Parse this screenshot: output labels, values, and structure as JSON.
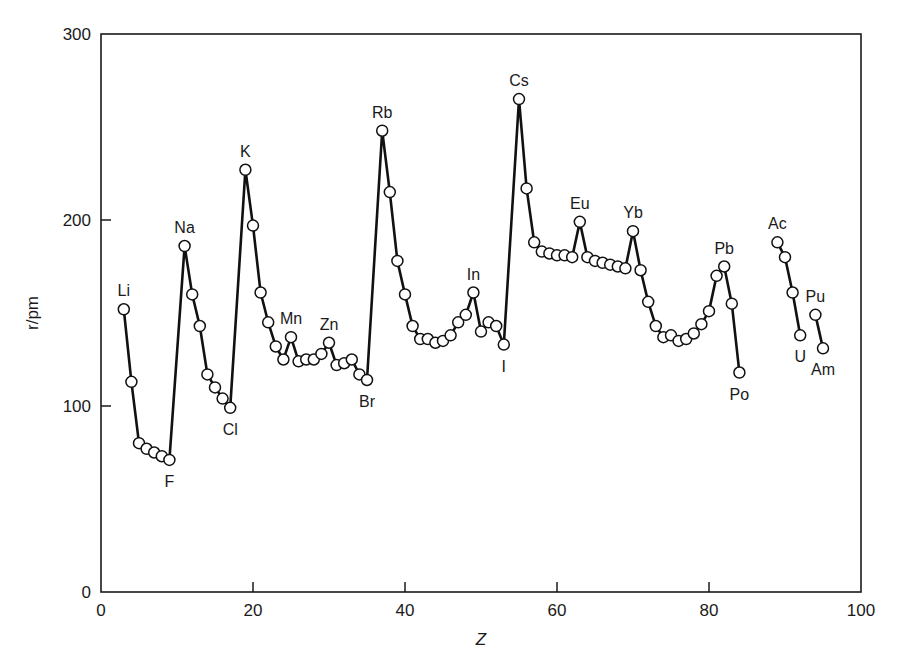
{
  "chart_data": {
    "type": "line",
    "title": "",
    "xlabel": "Z",
    "ylabel": "r/pm",
    "xlim": [
      0,
      100
    ],
    "ylim": [
      0,
      300
    ],
    "xticks": [
      0,
      20,
      40,
      60,
      80,
      100
    ],
    "yticks": [
      0,
      100,
      200,
      300
    ],
    "grid": false,
    "legend": null,
    "marker": "open-circle",
    "series": [
      {
        "name": "Li–Po",
        "points": [
          [
            3,
            152
          ],
          [
            4,
            113
          ],
          [
            5,
            80
          ],
          [
            6,
            77
          ],
          [
            7,
            75
          ],
          [
            8,
            73
          ],
          [
            9,
            71
          ],
          [
            11,
            186
          ],
          [
            12,
            160
          ],
          [
            13,
            143
          ],
          [
            14,
            117
          ],
          [
            15,
            110
          ],
          [
            16,
            104
          ],
          [
            17,
            99
          ],
          [
            19,
            227
          ],
          [
            20,
            197
          ],
          [
            21,
            161
          ],
          [
            22,
            145
          ],
          [
            23,
            132
          ],
          [
            24,
            125
          ],
          [
            25,
            137
          ],
          [
            26,
            124
          ],
          [
            27,
            125
          ],
          [
            28,
            125
          ],
          [
            29,
            128
          ],
          [
            30,
            134
          ],
          [
            31,
            122
          ],
          [
            32,
            123
          ],
          [
            33,
            125
          ],
          [
            34,
            117
          ],
          [
            35,
            114
          ],
          [
            37,
            248
          ],
          [
            38,
            215
          ],
          [
            39,
            178
          ],
          [
            40,
            160
          ],
          [
            41,
            143
          ],
          [
            42,
            136
          ],
          [
            43,
            136
          ],
          [
            44,
            134
          ],
          [
            45,
            135
          ],
          [
            46,
            138
          ],
          [
            47,
            145
          ],
          [
            48,
            149
          ],
          [
            49,
            161
          ],
          [
            50,
            140
          ],
          [
            51,
            145
          ],
          [
            52,
            143
          ],
          [
            53,
            133
          ],
          [
            55,
            265
          ],
          [
            56,
            217
          ],
          [
            57,
            188
          ],
          [
            58,
            183
          ],
          [
            59,
            182
          ],
          [
            60,
            181
          ],
          [
            61,
            181
          ],
          [
            62,
            180
          ],
          [
            63,
            199
          ],
          [
            64,
            180
          ],
          [
            65,
            178
          ],
          [
            66,
            177
          ],
          [
            67,
            176
          ],
          [
            68,
            175
          ],
          [
            69,
            174
          ],
          [
            70,
            194
          ],
          [
            71,
            173
          ],
          [
            72,
            156
          ],
          [
            73,
            143
          ],
          [
            74,
            137
          ],
          [
            75,
            138
          ],
          [
            76,
            135
          ],
          [
            77,
            136
          ],
          [
            78,
            139
          ],
          [
            79,
            144
          ],
          [
            80,
            151
          ],
          [
            81,
            170
          ],
          [
            82,
            175
          ],
          [
            83,
            155
          ],
          [
            84,
            118
          ]
        ]
      },
      {
        "name": "Ac–U",
        "points": [
          [
            89,
            188
          ],
          [
            90,
            180
          ],
          [
            91,
            161
          ],
          [
            92,
            138
          ]
        ]
      },
      {
        "name": "Pu–Am",
        "points": [
          [
            94,
            149
          ],
          [
            95,
            131
          ]
        ]
      }
    ],
    "annotations": [
      {
        "text": "Li",
        "z": 3,
        "pos": "above"
      },
      {
        "text": "F",
        "z": 9,
        "pos": "below"
      },
      {
        "text": "Na",
        "z": 11,
        "pos": "above"
      },
      {
        "text": "Cl",
        "z": 17,
        "pos": "below"
      },
      {
        "text": "K",
        "z": 19,
        "pos": "above"
      },
      {
        "text": "Mn",
        "z": 25,
        "pos": "above"
      },
      {
        "text": "Zn",
        "z": 30,
        "pos": "above"
      },
      {
        "text": "Br",
        "z": 35,
        "pos": "below"
      },
      {
        "text": "Rb",
        "z": 37,
        "pos": "above"
      },
      {
        "text": "In",
        "z": 49,
        "pos": "above"
      },
      {
        "text": "I",
        "z": 53,
        "pos": "below"
      },
      {
        "text": "Cs",
        "z": 55,
        "pos": "above"
      },
      {
        "text": "Eu",
        "z": 63,
        "pos": "above"
      },
      {
        "text": "Yb",
        "z": 70,
        "pos": "above"
      },
      {
        "text": "Pb",
        "z": 82,
        "pos": "above"
      },
      {
        "text": "Po",
        "z": 84,
        "pos": "below"
      },
      {
        "text": "Ac",
        "z": 89,
        "pos": "above"
      },
      {
        "text": "U",
        "z": 92,
        "pos": "below"
      },
      {
        "text": "Pu",
        "z": 94,
        "pos": "above"
      },
      {
        "text": "Am",
        "z": 95,
        "pos": "below"
      }
    ]
  },
  "colors": {
    "line": "#111111",
    "marker_fill": "#ffffff",
    "axis": "#1a1a1a"
  }
}
